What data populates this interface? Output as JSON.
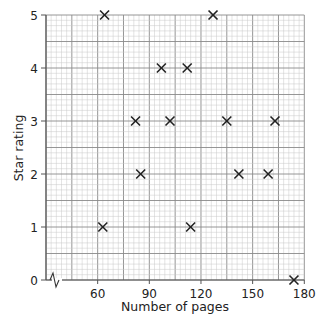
{
  "chart_data": {
    "type": "scatter",
    "title": "",
    "xlabel": "Number of pages",
    "ylabel": "Star rating",
    "xlim": [
      30,
      180
    ],
    "ylim": [
      0,
      5
    ],
    "x_axis_break": true,
    "grid": {
      "on": true,
      "major_x_step": 15,
      "minor_x_step": 3,
      "major_y_step": 0.5,
      "minor_y_step": 0.1
    },
    "x_ticks": [
      60,
      90,
      120,
      150,
      180
    ],
    "y_ticks": [
      0,
      1,
      2,
      3,
      4,
      5
    ],
    "marker": "x",
    "points": [
      {
        "x": 64,
        "y": 5
      },
      {
        "x": 127,
        "y": 5
      },
      {
        "x": 97,
        "y": 4
      },
      {
        "x": 112,
        "y": 4
      },
      {
        "x": 82,
        "y": 3
      },
      {
        "x": 102,
        "y": 3
      },
      {
        "x": 135,
        "y": 3
      },
      {
        "x": 163,
        "y": 3
      },
      {
        "x": 85,
        "y": 2
      },
      {
        "x": 142,
        "y": 2
      },
      {
        "x": 159,
        "y": 2
      },
      {
        "x": 63,
        "y": 1
      },
      {
        "x": 114,
        "y": 1
      },
      {
        "x": 174,
        "y": 0
      }
    ]
  },
  "colors": {
    "minor_grid": "#c8c8c8",
    "major_grid": "#8a8a8a",
    "axis": "#555555",
    "marker": "#222222"
  }
}
